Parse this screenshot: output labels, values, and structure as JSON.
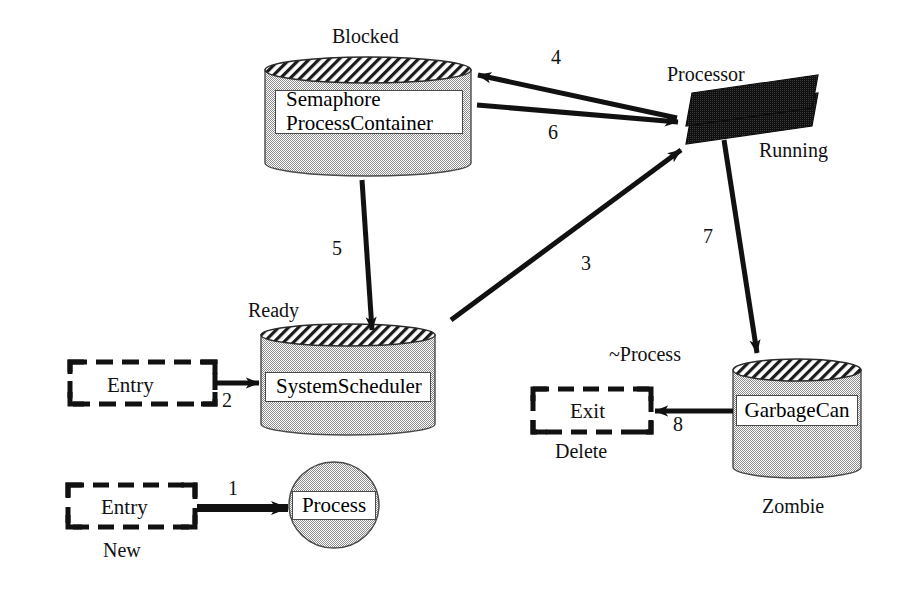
{
  "diagram": {
    "background_color": "#ffffff",
    "ink_color": "#111111",
    "fill_gray": "#b9b9b9",
    "dark_fill": "#151515"
  },
  "nodes": {
    "blocked": {
      "state_label": "Blocked",
      "shape": "cylinder",
      "lines": [
        "Semaphore",
        "ProcessContainer"
      ],
      "line1": "Semaphore",
      "line2": "ProcessContainer"
    },
    "ready": {
      "state_label": "Ready",
      "shape": "cylinder",
      "text": "SystemScheduler"
    },
    "zombie": {
      "state_label": "Zombie",
      "shape": "cylinder",
      "text": "GarbageCan"
    },
    "running": {
      "state_label": "Running",
      "shape": "stacked-parallelogram",
      "text": "Processor"
    },
    "new": {
      "state_label": "New",
      "shape": "circle",
      "text": "Process"
    },
    "entry_new": {
      "shape": "dashed-box",
      "text": "Entry"
    },
    "entry_ready": {
      "shape": "dashed-box",
      "text": "Entry"
    },
    "exit_delete": {
      "shape": "dashed-box",
      "text": "Exit",
      "state_label": "Delete",
      "operation_label": "~Process"
    }
  },
  "edges": [
    {
      "id": "e1",
      "label": "1",
      "from": "entry_new",
      "to": "new",
      "style": "thick-solid"
    },
    {
      "id": "e2",
      "label": "2",
      "from": "entry_ready",
      "to": "ready",
      "style": "thick-solid"
    },
    {
      "id": "e3",
      "label": "3",
      "from": "ready",
      "to": "running",
      "style": "thick-solid"
    },
    {
      "id": "e4",
      "label": "4",
      "from": "running",
      "to": "blocked",
      "style": "thick-solid"
    },
    {
      "id": "e5",
      "label": "5",
      "from": "blocked",
      "to": "ready",
      "style": "thick-solid"
    },
    {
      "id": "e6",
      "label": "6",
      "from": "blocked",
      "to": "running",
      "style": "thick-solid"
    },
    {
      "id": "e7",
      "label": "7",
      "from": "running",
      "to": "zombie",
      "style": "thick-solid"
    },
    {
      "id": "e8",
      "label": "8",
      "from": "zombie",
      "to": "exit_delete",
      "style": "thick-solid"
    }
  ],
  "edge_labels": {
    "one": "1",
    "two": "2",
    "three": "3",
    "four": "4",
    "five": "5",
    "six": "6",
    "seven": "7",
    "eight": "8"
  }
}
